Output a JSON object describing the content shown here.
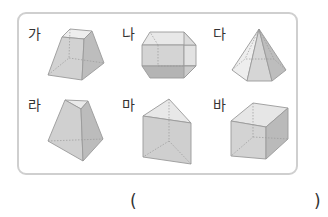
{
  "problem": {
    "figures": [
      {
        "label": "가",
        "shape": "square-frustum"
      },
      {
        "label": "나",
        "shape": "truncated-prism"
      },
      {
        "label": "다",
        "shape": "hexagonal-pyramid"
      },
      {
        "label": "라",
        "shape": "triangular-frustum"
      },
      {
        "label": "마",
        "shape": "triangular-prism"
      },
      {
        "label": "바",
        "shape": "cube"
      }
    ],
    "answer": {
      "open_paren": "(",
      "close_paren": ")"
    }
  },
  "colors": {
    "frame_border": "#cfcfcf",
    "face_light": "#e4e4e4",
    "face_mid": "#cdcdcd",
    "face_dark": "#b4b4b4",
    "edge": "#9a9a9a"
  }
}
